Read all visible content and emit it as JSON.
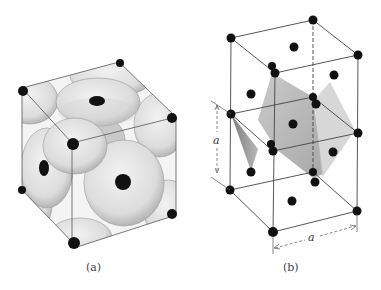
{
  "figure": {
    "panels": [
      {
        "id": "a",
        "caption": "(a)",
        "description": "Hard-sphere model of a unit cell with truncated spheres at cube corners and face centers"
      },
      {
        "id": "b",
        "caption": "(b)",
        "description": "Two stacked cubic unit cells of lattice points with shaded planes",
        "dimension_labels": {
          "vertical": "a",
          "horizontal": "a"
        }
      }
    ]
  },
  "colors": {
    "atom": "#111111",
    "edge": "#333333",
    "sphere_light": "#e6e6e6",
    "sphere_shade": "#b8b8b8",
    "plane": "#9a9a9a"
  }
}
